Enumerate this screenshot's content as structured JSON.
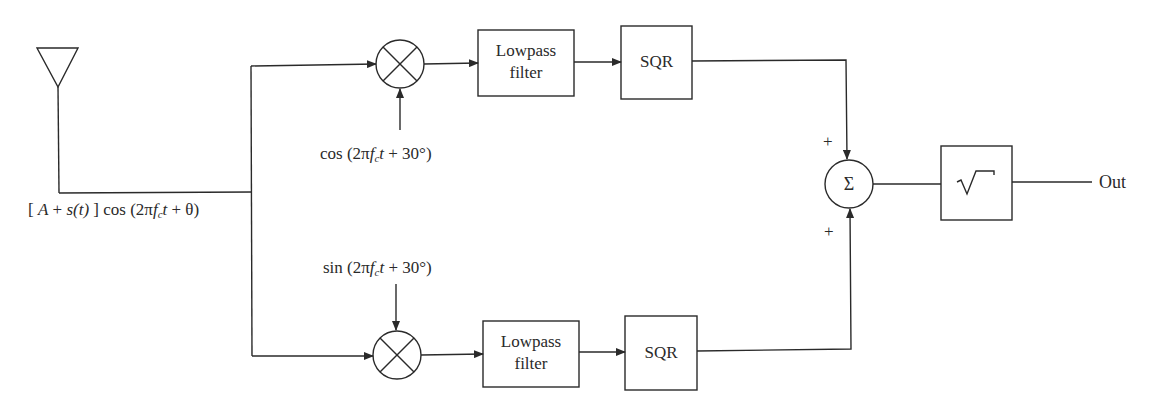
{
  "diagram": {
    "type": "block-diagram",
    "input": {
      "icon": "antenna-icon",
      "signal_label_parts": [
        "[ ",
        "A",
        " + ",
        "s(t)",
        " ]  cos (2π",
        "f",
        "c",
        "t",
        " + θ)"
      ]
    },
    "top_branch": {
      "mixer_icon": "multiplier-icon",
      "oscillator_label_parts": [
        "cos (2π",
        "f",
        "c",
        "t",
        " + 30°)"
      ],
      "filter_label_line1": "Lowpass",
      "filter_label_line2": "filter",
      "squarer_label": "SQR",
      "sum_sign": "+"
    },
    "bottom_branch": {
      "mixer_icon": "multiplier-icon",
      "oscillator_label_parts": [
        "sin (2π",
        "f",
        "c",
        "t",
        " + 30°)"
      ],
      "filter_label_line1": "Lowpass",
      "filter_label_line2": "filter",
      "squarer_label": "SQR",
      "sum_sign": "+"
    },
    "summer": {
      "symbol": "Σ"
    },
    "sqrt_block": {
      "symbol": "√"
    },
    "output_label": "Out",
    "colors": {
      "line": "#2a2a2a",
      "background": "#ffffff"
    }
  }
}
